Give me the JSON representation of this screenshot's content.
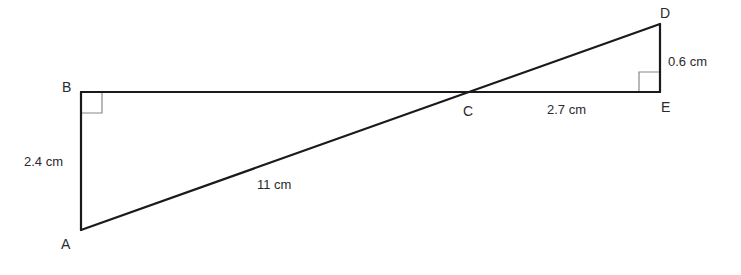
{
  "diagram": {
    "type": "geometry-similar-triangles",
    "points": {
      "A": {
        "label": "A",
        "x": 81,
        "y": 230
      },
      "B": {
        "label": "B",
        "x": 81,
        "y": 92
      },
      "C": {
        "label": "C",
        "x": 467,
        "y": 92
      },
      "D": {
        "label": "D",
        "x": 660,
        "y": 24
      },
      "E": {
        "label": "E",
        "x": 660,
        "y": 92
      }
    },
    "segments": [
      {
        "from": "A",
        "to": "B"
      },
      {
        "from": "B",
        "to": "E"
      },
      {
        "from": "A",
        "to": "D"
      },
      {
        "from": "D",
        "to": "E"
      }
    ],
    "right_angles": [
      "B",
      "E"
    ],
    "measurements": {
      "AB": "2.4 cm",
      "AC": "11 cm",
      "CE": "2.7 cm",
      "DE": "0.6 cm"
    }
  }
}
